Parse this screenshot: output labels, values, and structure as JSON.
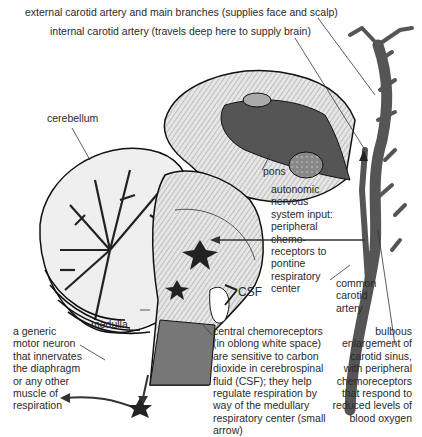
{
  "labels": {
    "external_carotid": "external carotid artery and main branches (supplies face and scalp)",
    "internal_carotid": "internal carotid artery (travels deep here to supply brain)",
    "cerebellum": "cerebellum",
    "pons": "pons",
    "autonomic": "autonomic\nnervous\nsystem input:\nperipheral\nchemo-\nreceptors to\npontine\nrespiratory\ncenter",
    "common_carotid": "common\ncarotid\nartery",
    "csf": "CSF",
    "medulla": "medulla",
    "central_chemo": "central chemoreceptors\n(in oblong white space)\nare sensitive to carbon\ndioxide in cerebrospinal\nfluid (CSF); they help\nregulate respiration by\nway of the medullary\nrespiratory center (small\narrow)",
    "bulbous": "bulbous\nenlargement of\ncarotid sinus,\nwith peripheral\nchemoreceptors\nthat respond to\nreduced levels of\nblood oxygen",
    "motor_neuron": "a generic\nmotor neuron\nthat innervates\nthe diaphragm\nor any other\nmuscle of\nrespiration"
  },
  "colors": {
    "artery": "#555555",
    "line": "#333333",
    "tissue_light": "#d8d8d8",
    "tissue_dark": "#4a4a4a"
  }
}
